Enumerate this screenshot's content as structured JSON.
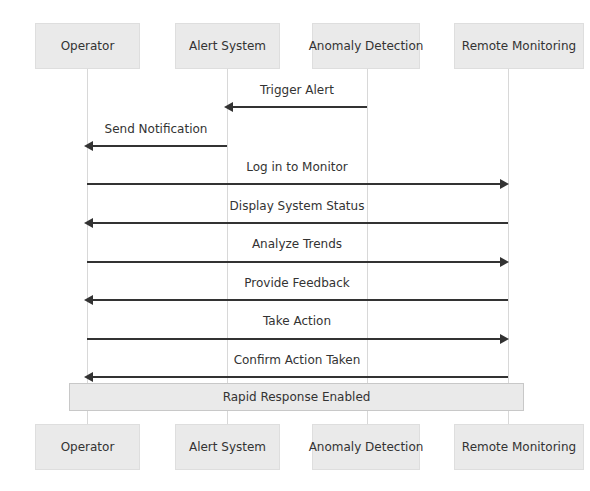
{
  "diagram": {
    "type": "sequence",
    "actors": [
      {
        "id": "operator",
        "label": "Operator"
      },
      {
        "id": "alert_system",
        "label": "Alert System"
      },
      {
        "id": "anomaly_detection",
        "label": "Anomaly Detection"
      },
      {
        "id": "remote_monitoring",
        "label": "Remote Monitoring"
      }
    ],
    "messages": [
      {
        "from": "Anomaly Detection",
        "to": "Alert System",
        "label": "Trigger Alert"
      },
      {
        "from": "Alert System",
        "to": "Operator",
        "label": "Send Notification"
      },
      {
        "from": "Operator",
        "to": "Remote Monitoring",
        "label": "Log in to Monitor"
      },
      {
        "from": "Remote Monitoring",
        "to": "Operator",
        "label": "Display System Status"
      },
      {
        "from": "Operator",
        "to": "Remote Monitoring",
        "label": "Analyze Trends"
      },
      {
        "from": "Remote Monitoring",
        "to": "Operator",
        "label": "Provide Feedback"
      },
      {
        "from": "Operator",
        "to": "Remote Monitoring",
        "label": "Take Action"
      },
      {
        "from": "Remote Monitoring",
        "to": "Operator",
        "label": "Confirm Action Taken"
      }
    ],
    "note": {
      "over": [
        "Operator",
        "Remote Monitoring"
      ],
      "label": "Rapid Response Enabled"
    },
    "colors": {
      "actor_fill": "#eaeaea",
      "actor_border": "#dedede",
      "lifeline": "#d8d8d8",
      "arrow": "#333333",
      "text": "#333333",
      "note_fill": "#eaeaea",
      "note_border": "#c8c8c8"
    }
  }
}
